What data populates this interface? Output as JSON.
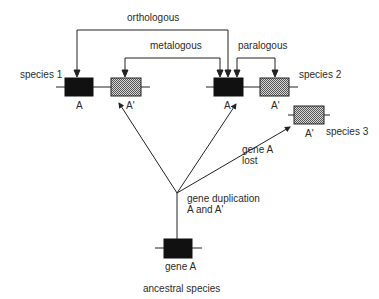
{
  "relations": {
    "orthologous": "orthologous",
    "metalogous": "metalogous",
    "paralogous": "paralogous"
  },
  "species": {
    "species1": "species 1",
    "species2": "species 2",
    "species3": "species 3",
    "ancestral": "ancestral species"
  },
  "genes": {
    "s1_a": "A",
    "s1_a_prime": "A'",
    "s2_a": "A",
    "s2_a_prime": "A'",
    "s3_a_prime": "A'",
    "ancestral_gene": "gene A"
  },
  "events": {
    "duplication_line1": "gene duplication",
    "duplication_line2": "A and A'",
    "loss_line1": "gene A",
    "loss_line2": "lost"
  },
  "colors": {
    "gene_a_fill": "#111111",
    "gene_a_prime_fill": "#9a9a9a",
    "line": "#222222"
  }
}
